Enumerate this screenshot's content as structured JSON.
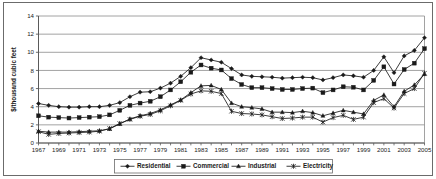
{
  "chart_data": {
    "type": "line",
    "title": "",
    "subtitle": "",
    "xlabel": "",
    "ylabel": "$/thousand cubic feet",
    "xlim": [
      1967,
      2005
    ],
    "ylim": [
      0,
      14
    ],
    "ytick_step": 2,
    "xtick_step": 2,
    "grid": "horizontal",
    "legend_position": "bottom",
    "x": [
      1967,
      1968,
      1969,
      1970,
      1971,
      1972,
      1973,
      1974,
      1975,
      1976,
      1977,
      1978,
      1979,
      1980,
      1981,
      1982,
      1983,
      1984,
      1985,
      1986,
      1987,
      1988,
      1989,
      1990,
      1991,
      1992,
      1993,
      1994,
      1995,
      1996,
      1997,
      1998,
      1999,
      2000,
      2001,
      2002,
      2003,
      2004,
      2005
    ],
    "xtick_labels": [
      "1967",
      "1969",
      "1971",
      "1973",
      "1975",
      "1977",
      "1979",
      "1981",
      "1983",
      "1985",
      "1987",
      "1989",
      "1991",
      "1993",
      "1995",
      "1997",
      "1999",
      "2001",
      "2003",
      "2005"
    ],
    "ytick_labels": [
      "0",
      "2",
      "4",
      "6",
      "8",
      "10",
      "12",
      "14"
    ],
    "series": [
      {
        "name": "Residential",
        "marker": "diamond",
        "color": "#1a1a1a",
        "values": [
          4.35,
          4.15,
          4.0,
          3.95,
          3.95,
          4.0,
          4.0,
          4.15,
          4.45,
          5.1,
          5.6,
          5.65,
          6.05,
          6.6,
          7.35,
          8.3,
          9.4,
          9.15,
          8.9,
          8.2,
          7.5,
          7.35,
          7.3,
          7.25,
          7.15,
          7.2,
          7.25,
          7.2,
          6.95,
          7.2,
          7.5,
          7.4,
          7.25,
          8.0,
          9.5,
          7.75,
          9.6,
          10.2,
          11.6
        ]
      },
      {
        "name": "Commercial",
        "marker": "square",
        "color": "#1a1a1a",
        "values": [
          3.0,
          2.85,
          2.8,
          2.75,
          2.8,
          2.85,
          2.9,
          3.1,
          3.6,
          4.15,
          4.4,
          4.6,
          5.1,
          5.85,
          6.75,
          7.8,
          8.6,
          8.25,
          8.05,
          7.1,
          6.45,
          6.1,
          6.1,
          6.0,
          5.9,
          5.9,
          6.0,
          6.05,
          5.55,
          5.85,
          6.2,
          6.15,
          5.85,
          6.9,
          8.4,
          6.5,
          8.1,
          8.8,
          10.4
        ]
      },
      {
        "name": "Industrial",
        "marker": "triangle",
        "color": "#1a1a1a",
        "values": [
          1.3,
          1.2,
          1.2,
          1.2,
          1.25,
          1.3,
          1.35,
          1.55,
          2.1,
          2.65,
          3.0,
          3.25,
          3.65,
          4.2,
          4.75,
          5.55,
          6.3,
          6.35,
          5.9,
          4.4,
          4.0,
          3.9,
          3.75,
          3.4,
          3.4,
          3.35,
          3.5,
          3.35,
          3.0,
          3.3,
          3.6,
          3.4,
          3.2,
          4.7,
          5.3,
          4.0,
          5.7,
          6.4,
          7.6
        ]
      },
      {
        "name": "Electricity",
        "marker": "star",
        "color": "#1a1a1a",
        "values": [
          1.25,
          0.95,
          1.05,
          1.1,
          1.15,
          1.2,
          1.3,
          1.6,
          2.15,
          2.6,
          2.95,
          3.15,
          3.55,
          4.1,
          4.7,
          5.4,
          5.75,
          5.7,
          5.45,
          3.5,
          3.25,
          3.2,
          3.1,
          2.9,
          2.7,
          2.75,
          2.85,
          2.85,
          2.3,
          2.8,
          3.05,
          2.6,
          2.85,
          4.45,
          4.9,
          3.85,
          5.45,
          6.0,
          7.7
        ]
      }
    ]
  },
  "legend": {
    "items": [
      {
        "label": "Residential"
      },
      {
        "label": "Commercial"
      },
      {
        "label": "Industrial"
      },
      {
        "label": "Electricity"
      }
    ]
  }
}
